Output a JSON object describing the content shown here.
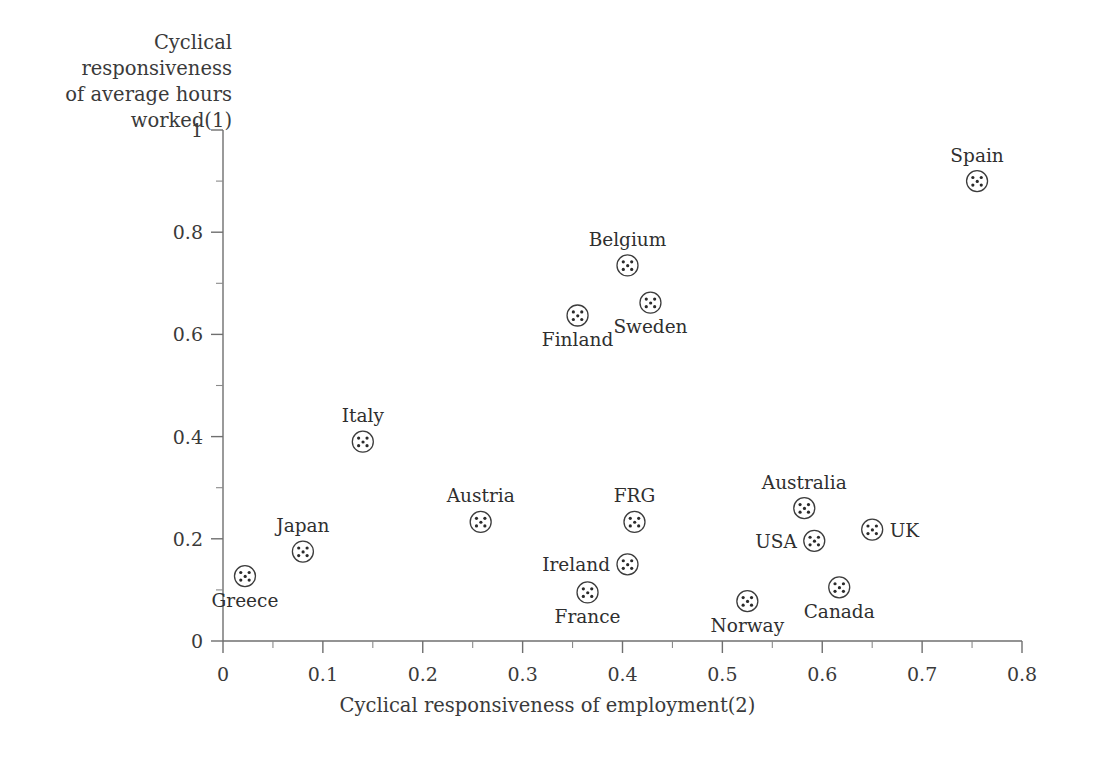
{
  "figure": {
    "y_axis_title": "Cyclical responsiveness\nof average hours\nworked(1)",
    "x_axis_title": "Cyclical responsiveness of employment(2)",
    "background_color": "#ffffff",
    "axis_color": "#6f6f6f",
    "marker_color": "#3c3c3c",
    "text_color": "#2f2f2f"
  },
  "chart_data": {
    "type": "scatter",
    "title": "",
    "xlabel": "Cyclical responsiveness of employment(2)",
    "ylabel": "Cyclical responsiveness of average hours worked(1)",
    "xlim": [
      0,
      0.8
    ],
    "ylim": [
      0,
      1
    ],
    "xticks": [
      0,
      0.1,
      0.2,
      0.3,
      0.4,
      0.5,
      0.6,
      0.7,
      0.8
    ],
    "xticklabels": [
      "0",
      "0.1",
      "0.2",
      "0.3",
      "0.4",
      "0.5",
      "0.6",
      "0.7",
      "0.8"
    ],
    "yticks": [
      0,
      0.2,
      0.4,
      0.6,
      0.8,
      1
    ],
    "yticklabels": [
      "0",
      "0.2",
      "0.4",
      "0.6",
      "0.8",
      "1"
    ],
    "x_minor_step": 0.05,
    "y_minor_step": 0.1,
    "grid": false,
    "legend": null,
    "marker_style": "circle-with-dots",
    "points": [
      {
        "label": "Greece",
        "x": 0.022,
        "y": 0.127,
        "label_pos": "below"
      },
      {
        "label": "Japan",
        "x": 0.08,
        "y": 0.175,
        "label_pos": "above"
      },
      {
        "label": "Italy",
        "x": 0.14,
        "y": 0.39,
        "label_pos": "above"
      },
      {
        "label": "Austria",
        "x": 0.258,
        "y": 0.233,
        "label_pos": "above"
      },
      {
        "label": "France",
        "x": 0.365,
        "y": 0.095,
        "label_pos": "below"
      },
      {
        "label": "Finland",
        "x": 0.355,
        "y": 0.637,
        "label_pos": "below"
      },
      {
        "label": "Ireland",
        "x": 0.405,
        "y": 0.15,
        "label_pos": "left"
      },
      {
        "label": "FRG",
        "x": 0.412,
        "y": 0.233,
        "label_pos": "above"
      },
      {
        "label": "Belgium",
        "x": 0.405,
        "y": 0.735,
        "label_pos": "above"
      },
      {
        "label": "Sweden",
        "x": 0.428,
        "y": 0.662,
        "label_pos": "below"
      },
      {
        "label": "Norway",
        "x": 0.525,
        "y": 0.078,
        "label_pos": "below"
      },
      {
        "label": "USA",
        "x": 0.592,
        "y": 0.196,
        "label_pos": "left"
      },
      {
        "label": "Australia",
        "x": 0.582,
        "y": 0.26,
        "label_pos": "above"
      },
      {
        "label": "Canada",
        "x": 0.617,
        "y": 0.105,
        "label_pos": "below"
      },
      {
        "label": "UK",
        "x": 0.65,
        "y": 0.218,
        "label_pos": "right"
      },
      {
        "label": "Spain",
        "x": 0.755,
        "y": 0.9,
        "label_pos": "above"
      }
    ]
  }
}
